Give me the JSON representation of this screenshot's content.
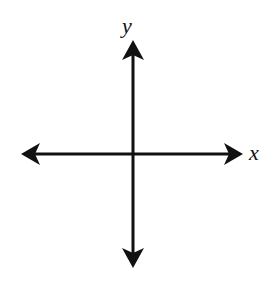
{
  "diagram": {
    "type": "coordinate-axes",
    "x_axis": {
      "label": "x",
      "direction": "bidirectional"
    },
    "y_axis": {
      "label": "y",
      "direction": "bidirectional"
    },
    "colors": {
      "axis": "#111111",
      "background": "#ffffff"
    }
  }
}
